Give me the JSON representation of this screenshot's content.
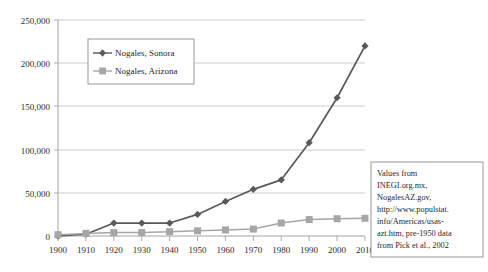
{
  "chart_data": {
    "type": "line",
    "title": "",
    "subtitle": "",
    "xlabel": "",
    "ylabel": "",
    "x": [
      1900,
      1910,
      1920,
      1930,
      1940,
      1950,
      1960,
      1970,
      1980,
      1990,
      2000,
      2010
    ],
    "categories": [
      "1900",
      "1910",
      "1920",
      "1930",
      "1940",
      "1950",
      "1960",
      "1970",
      "1980",
      "1990",
      "2000",
      "2010"
    ],
    "series": [
      {
        "name": "Nogales, Sonora",
        "marker": "diamond",
        "color": "#595959",
        "values": [
          0,
          2000,
          15000,
          15000,
          15000,
          25000,
          40000,
          54000,
          65000,
          108000,
          160000,
          220000
        ]
      },
      {
        "name": "Nogales, Arizona",
        "marker": "square",
        "color": "#a6a6a6",
        "values": [
          1500,
          3000,
          4000,
          4000,
          5000,
          6000,
          7000,
          8000,
          15000,
          19000,
          20000,
          20500
        ]
      }
    ],
    "ylim": [
      0,
      250000
    ],
    "xlim": [
      1900,
      2010
    ],
    "yticks": [
      0,
      50000,
      100000,
      150000,
      200000,
      250000
    ],
    "ytick_labels": [
      "0",
      "50,000",
      "100,000",
      "150,000",
      "200,000",
      "250,000"
    ],
    "xtick_labels": [
      "1900",
      "1910",
      "1920",
      "1930",
      "1940",
      "1950",
      "1960",
      "1970",
      "1980",
      "1990",
      "2000",
      "2010"
    ],
    "grid": "horizontal",
    "legend_position": "upper-left-inset",
    "annotations": [
      {
        "name": "source-note",
        "lines": [
          "Values from",
          "INEGI.org.mx,",
          "NogalesAZ.gov,",
          "http://www.populstat.",
          "info/Americas/usas-",
          "azt.htm, pre-1950 data",
          "from Pick et al., 2002"
        ],
        "position": "bottom-right"
      }
    ]
  },
  "legend": {
    "items": [
      {
        "label": "Nogales, Sonora",
        "marker": "diamond",
        "color": "#595959"
      },
      {
        "label": "Nogales, Arizona",
        "marker": "square",
        "color": "#a6a6a6"
      }
    ]
  },
  "note": {
    "line1": "Values from",
    "line2": "INEGI.org.mx,",
    "line3": "NogalesAZ.gov,",
    "line4": "http://www.populstat.",
    "line5": "info/Americas/usas-",
    "line6": "azt.htm, pre-1950 data",
    "line7": "from Pick et al., 2002"
  },
  "axis": {
    "y": {
      "t0": "0",
      "t1": "50,000",
      "t2": "100,000",
      "t3": "150,000",
      "t4": "200,000",
      "t5": "250,000"
    },
    "x": {
      "t0": "1900",
      "t1": "1910",
      "t2": "1920",
      "t3": "1930",
      "t4": "1940",
      "t5": "1950",
      "t6": "1960",
      "t7": "1970",
      "t8": "1980",
      "t9": "1990",
      "t10": "2000",
      "t11": "2010"
    }
  },
  "colors": {
    "sonora": "#595959",
    "arizona": "#a6a6a6",
    "grid": "#bfbfbf",
    "axis": "#9a9a9a",
    "frame": "#8c8c8c",
    "background": "#ffffff"
  }
}
